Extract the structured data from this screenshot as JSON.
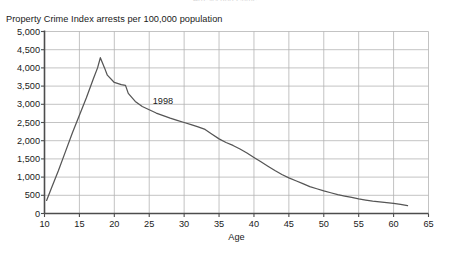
{
  "figure": {
    "cut_off_header": "Arrests and Crime",
    "background_color": "#ffffff",
    "axis_color": "#4d4d4d",
    "grid_color": "#b4b4b4",
    "line_color": "#555555",
    "text_color": "#1a1a1a"
  },
  "chart_data": {
    "type": "line",
    "title": "",
    "ylabel": "Property Crime Index arrests per 100,000 population",
    "xlabel": "Age",
    "xlim": [
      10,
      65
    ],
    "ylim": [
      0,
      5000
    ],
    "xticks": [
      10,
      15,
      20,
      25,
      30,
      35,
      40,
      45,
      50,
      55,
      60,
      65
    ],
    "xtick_labels": [
      "10",
      "15",
      "20",
      "25",
      "30",
      "35",
      "40",
      "45",
      "50",
      "55",
      "60",
      "65"
    ],
    "yticks": [
      0,
      500,
      1000,
      1500,
      2000,
      2500,
      3000,
      3500,
      4000,
      4500,
      5000
    ],
    "ytick_labels": [
      "0",
      "500",
      "1,000",
      "1,500",
      "2,000",
      "2,500",
      "3,000",
      "3,500",
      "4,000",
      "4,500",
      "5,000"
    ],
    "grid": true,
    "legend": false,
    "annotations": [
      {
        "text": "1998",
        "x": 25.5,
        "y": 3050
      }
    ],
    "series": [
      {
        "name": "1998",
        "x": [
          10.3,
          11,
          12,
          13,
          14,
          15,
          16,
          17,
          17.6,
          18,
          18.6,
          19,
          20,
          21,
          21.6,
          22,
          23,
          24,
          25,
          26,
          27,
          28,
          29,
          30,
          31,
          32,
          33,
          34,
          35,
          36,
          37,
          38,
          39,
          40,
          41,
          42,
          43,
          44,
          45,
          46,
          47,
          48,
          49,
          50,
          51,
          52,
          53,
          54,
          55,
          56,
          57,
          58,
          59,
          60,
          61,
          62
        ],
        "y": [
          360,
          700,
          1180,
          1700,
          2220,
          2700,
          3180,
          3700,
          4000,
          4280,
          4000,
          3800,
          3600,
          3540,
          3520,
          3300,
          3080,
          2940,
          2850,
          2760,
          2690,
          2620,
          2560,
          2500,
          2440,
          2380,
          2310,
          2180,
          2050,
          1950,
          1870,
          1770,
          1660,
          1540,
          1420,
          1300,
          1180,
          1070,
          980,
          900,
          820,
          740,
          680,
          620,
          570,
          520,
          480,
          440,
          400,
          370,
          340,
          320,
          300,
          280,
          250,
          215
        ]
      }
    ]
  }
}
